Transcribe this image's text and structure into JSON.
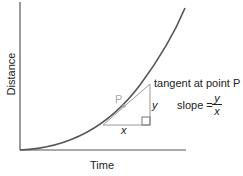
{
  "diagram": {
    "x_axis_label": "Time",
    "y_axis_label": "Distance",
    "tangent_label": "tangent at point P",
    "point_label": "P",
    "triangle": {
      "horizontal_label": "x",
      "vertical_label": "y"
    },
    "slope": {
      "text": "slope =",
      "numerator": "y",
      "denominator": "x"
    },
    "colors": {
      "curve": "#555555",
      "axes": "#555555",
      "triangle": "#999999",
      "point": "#aaaaaa"
    }
  }
}
